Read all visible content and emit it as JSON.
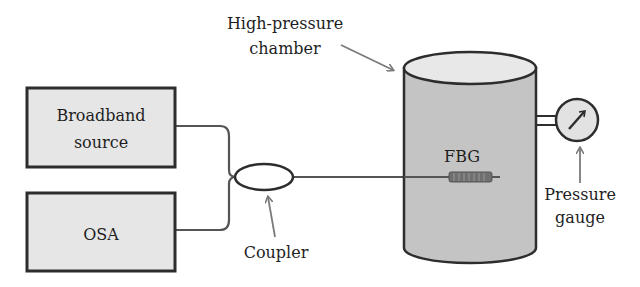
{
  "diagram": {
    "colors": {
      "background": "#ffffff",
      "box_fill": "#e6e6e6",
      "chamber_fill": "#c4c4c4",
      "chamber_top_fill": "#e8e8e8",
      "outline": "#2d2d2d",
      "fiber": "#555555",
      "arrow": "#7a7a7a",
      "text": "#1e1e1e"
    },
    "components": {
      "broadband_source": {
        "line1": "Broadband",
        "line2": "source"
      },
      "osa": {
        "label": "OSA"
      },
      "coupler": {
        "label": "Coupler"
      },
      "chamber": {
        "line1": "High-pressure",
        "line2": "chamber"
      },
      "fbg": {
        "label": "FBG"
      },
      "gauge": {
        "line1": "Pressure",
        "line2": "gauge"
      }
    }
  }
}
